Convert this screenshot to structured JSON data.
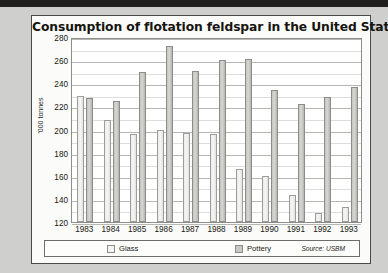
{
  "card": {
    "title": "Consumption of flotation feldspar in the United States"
  },
  "legend": {
    "glass_label": "Glass",
    "pottery_label": "Pottery",
    "source": "Source: USBM"
  },
  "chart_data": {
    "type": "bar",
    "title": "Consumption of flotation feldspar in the United States",
    "xlabel": "",
    "ylabel": "'000 tonnes",
    "ylim": [
      120,
      280
    ],
    "ytick_step": 20,
    "yticks": [
      120,
      140,
      160,
      180,
      200,
      220,
      240,
      260,
      280
    ],
    "grid": true,
    "legend_position": "bottom",
    "categories": [
      "1983",
      "1984",
      "1985",
      "1986",
      "1987",
      "1988",
      "1989",
      "1990",
      "1991",
      "1992",
      "1993"
    ],
    "series": [
      {
        "name": "Glass",
        "values": [
          229,
          208,
          196,
          200,
          197,
          196,
          166,
          160,
          143,
          128,
          133
        ]
      },
      {
        "name": "Pottery",
        "values": [
          227,
          225,
          250,
          272,
          251,
          260,
          261,
          234,
          222,
          228,
          237
        ]
      }
    ]
  }
}
